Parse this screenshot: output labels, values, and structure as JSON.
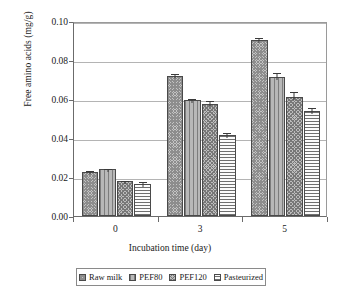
{
  "chart_data": {
    "type": "bar",
    "title": "",
    "xlabel": "Incubation time (day)",
    "ylabel": "Free amino acids (mg/g)",
    "categories": [
      "0",
      "3",
      "5"
    ],
    "ylim": [
      0,
      0.1
    ],
    "ytick_labels": [
      "0.00",
      "0.02",
      "0.04",
      "0.06",
      "0.08",
      "0.10"
    ],
    "ytick_values": [
      0,
      0.02,
      0.04,
      0.06,
      0.08,
      0.1
    ],
    "grid": true,
    "legend_position": "bottom",
    "series": [
      {
        "name": "Raw milk",
        "pattern": "checker",
        "values": [
          0.0225,
          0.072,
          0.0905
        ],
        "errors": [
          0.0015,
          0.002,
          0.002
        ]
      },
      {
        "name": "PEF80",
        "pattern": "vertical-lines",
        "values": [
          0.024,
          0.0595,
          0.0715
        ],
        "errors": [
          0.0013,
          0.0017,
          0.003
        ]
      },
      {
        "name": "PEF120",
        "pattern": "dense-checker",
        "values": [
          0.0178,
          0.0575,
          0.061
        ],
        "errors": [
          0.0012,
          0.0025,
          0.0035
        ]
      },
      {
        "name": "Pasteurized",
        "pattern": "horizontal-lines",
        "values": [
          0.0165,
          0.0415,
          0.054
        ],
        "errors": [
          0.0018,
          0.0022,
          0.0022
        ]
      }
    ]
  }
}
